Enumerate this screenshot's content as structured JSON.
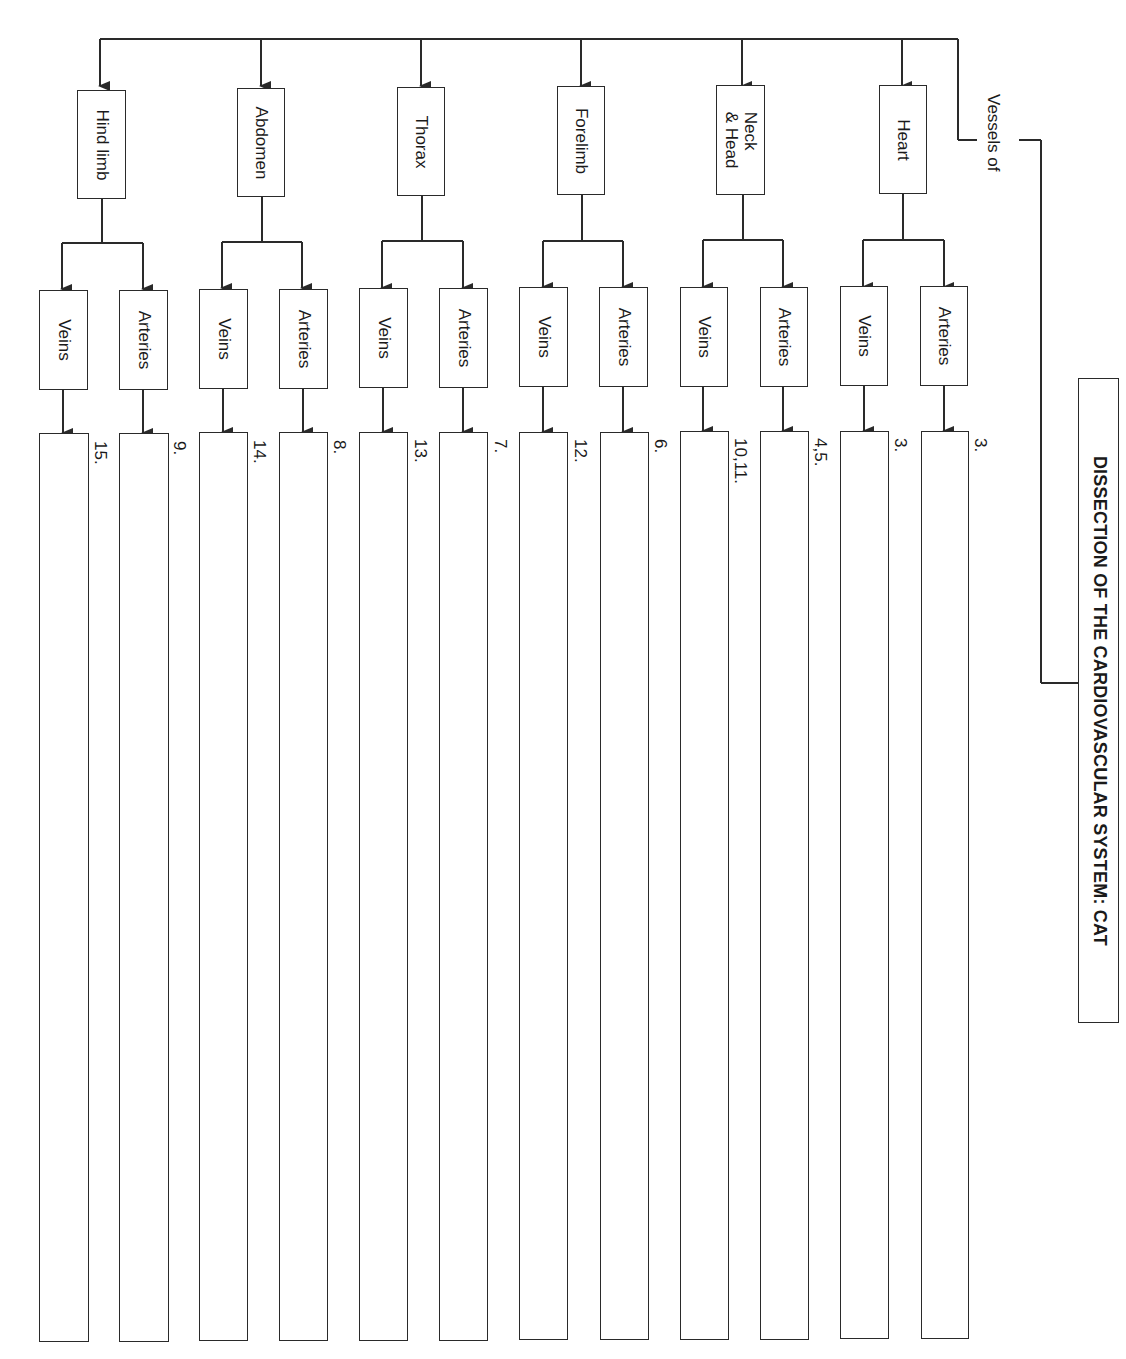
{
  "title": "DISSECTION OF THE CARDIOVASCULAR SYSTEM: CAT",
  "root_label": "Vessels of",
  "sub_labels": {
    "arteries": "Arteries",
    "veins": "Veins"
  },
  "regions": [
    {
      "name": "Heart",
      "arteries_num": "3.",
      "veins_num": "3."
    },
    {
      "name": "Neck\n& Head",
      "line1": "Neck",
      "line2": "& Head",
      "arteries_num": "4,5.",
      "veins_num": "10,11."
    },
    {
      "name": "Forelimb",
      "arteries_num": "6.",
      "veins_num": "12."
    },
    {
      "name": "Thorax",
      "arteries_num": "7.",
      "veins_num": "13."
    },
    {
      "name": "Abdomen",
      "arteries_num": "8.",
      "veins_num": "14."
    },
    {
      "name": "Hind limb",
      "arteries_num": "9.",
      "veins_num": "15."
    }
  ],
  "colors": {
    "line": "#2a2a2a",
    "background": "#ffffff"
  }
}
